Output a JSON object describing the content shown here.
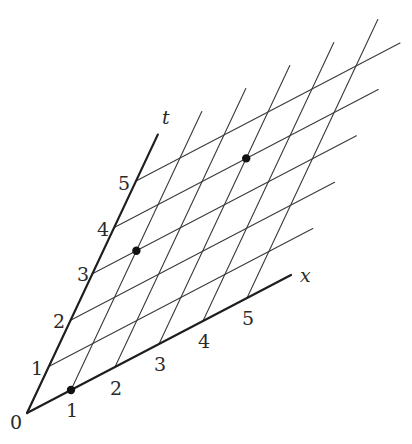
{
  "diagram": {
    "type": "oblique spacetime lattice",
    "origin_px": [
      27,
      413
    ],
    "x_unit_px": [
      44,
      -23
    ],
    "t_unit_px": [
      21.8,
      -46.4
    ],
    "colors": {
      "grid": "#3a3a3a",
      "axis": "#1e1e1e",
      "dot": "#111111",
      "text": "#2a2a2a"
    },
    "axes": {
      "x": {
        "name": "x",
        "extent": 6,
        "name_pos_px": [
          300,
          282
        ]
      },
      "t": {
        "name": "t",
        "extent": 6,
        "name_pos_px": [
          162,
          124
        ]
      }
    },
    "grid": {
      "constant_x_lines": {
        "values": [
          1,
          2,
          3,
          4,
          5
        ],
        "t_range": [
          0,
          6
        ]
      },
      "constant_t_lines": {
        "values": [
          1,
          2,
          3,
          4,
          5
        ],
        "x_range": [
          0,
          6
        ]
      }
    },
    "origin_label": {
      "text": "0",
      "pos_px": [
        10,
        429
      ]
    },
    "x_tick_labels": [
      {
        "text": "1",
        "pos_px": [
          66,
          417
        ]
      },
      {
        "text": "2",
        "pos_px": [
          110,
          395
        ]
      },
      {
        "text": "3",
        "pos_px": [
          154,
          371
        ]
      },
      {
        "text": "4",
        "pos_px": [
          198,
          348
        ]
      },
      {
        "text": "5",
        "pos_px": [
          242,
          325
        ]
      }
    ],
    "t_tick_labels": [
      {
        "text": "1",
        "pos_px": [
          31,
          375
        ]
      },
      {
        "text": "2",
        "pos_px": [
          53,
          328
        ]
      },
      {
        "text": "3",
        "pos_px": [
          77,
          281
        ]
      },
      {
        "text": "4",
        "pos_px": [
          97,
          236
        ]
      },
      {
        "text": "5",
        "pos_px": [
          118,
          190
        ]
      }
    ],
    "events": [
      {
        "x": 1,
        "t": 0,
        "label": "event at x=1, t=0"
      },
      {
        "x": 1,
        "t": 3,
        "label": "event at x=1, t=3"
      },
      {
        "x": 3,
        "t": 4,
        "label": "event at x=3, t=4"
      }
    ]
  }
}
